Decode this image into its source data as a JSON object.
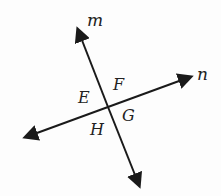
{
  "diagram": {
    "lines": [
      {
        "name": "m",
        "label": "m",
        "from": [
          79,
          30
        ],
        "to": [
          139,
          185
        ]
      },
      {
        "name": "n",
        "label": "n",
        "from": [
          26,
          137
        ],
        "to": [
          190,
          76
        ]
      }
    ],
    "angle_labels": [
      "E",
      "F",
      "G",
      "H"
    ],
    "colors": {
      "stroke": "#1a1a1a",
      "text": "#222222",
      "background": "#fdfdfd"
    }
  }
}
